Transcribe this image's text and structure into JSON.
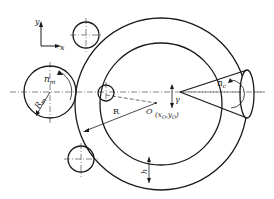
{
  "diagram": {
    "type": "ring-rolling schematic",
    "axes": {
      "x_label": "x",
      "y_label": "y"
    },
    "labels": {
      "mandrel_speed": "n",
      "mandrel_speed_sub": "m",
      "mandrel_radius": "R",
      "mandrel_radius_sub": "m",
      "ring_radius": "R",
      "center": "O",
      "center_coords": "(x",
      "center_coords_sub1": "O",
      "center_coords_mid": ",y",
      "center_coords_sub2": "O",
      "center_coords_end": ")",
      "angle": "γ",
      "cone_speed": "n",
      "cone_speed_sub": "c",
      "thickness": "h"
    },
    "colors": {
      "line": "#1a1a1a",
      "background": "#ffffff"
    }
  }
}
